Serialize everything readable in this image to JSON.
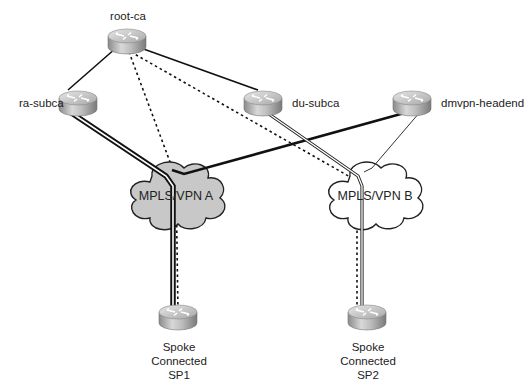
{
  "diagram": {
    "type": "network-topology",
    "nodes": {
      "root_ca": {
        "label": "root-ca"
      },
      "ra_subca": {
        "label": "ra-subca"
      },
      "du_subca": {
        "label": "du-subca"
      },
      "dmvpn_headend": {
        "label": "dmvpn-headend"
      },
      "spoke1": {
        "line1": "Spoke",
        "line2": "Connected",
        "line3": "SP1"
      },
      "spoke2": {
        "line1": "Spoke",
        "line2": "Connected",
        "line3": "SP2"
      }
    },
    "clouds": {
      "mpls_a": {
        "label": "MPLS/VPN A",
        "fill": "#c8c8c8"
      },
      "mpls_b": {
        "label": "MPLS/VPN B",
        "fill": "#ffffff"
      }
    },
    "links": [
      {
        "from": "root-ca",
        "to": "ra-subca",
        "style": "solid"
      },
      {
        "from": "root-ca",
        "to": "du-subca",
        "style": "solid"
      },
      {
        "from": "root-ca",
        "to": "Spoke Connected SP1",
        "via": "MPLS/VPN A",
        "style": "dotted"
      },
      {
        "from": "root-ca",
        "to": "Spoke Connected SP2",
        "via": "MPLS/VPN B",
        "style": "dotted"
      },
      {
        "from": "ra-subca",
        "to": "Spoke Connected SP1",
        "via": "MPLS/VPN A",
        "style": "double-thick"
      },
      {
        "from": "du-subca",
        "to": "Spoke Connected SP2",
        "via": "MPLS/VPN B",
        "style": "double-thin"
      },
      {
        "from": "dmvpn-headend",
        "to": "Spoke Connected SP1",
        "via": "MPLS/VPN A",
        "style": "thick"
      },
      {
        "from": "dmvpn-headend",
        "to": "Spoke Connected SP2",
        "via": "MPLS/VPN B",
        "style": "thin"
      }
    ]
  }
}
